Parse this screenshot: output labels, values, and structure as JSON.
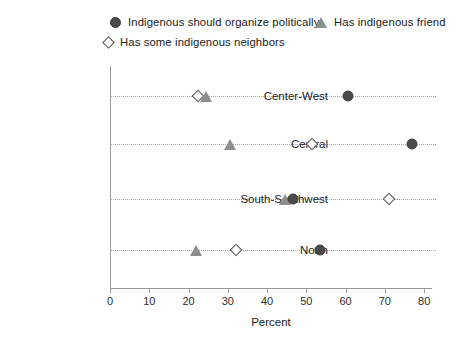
{
  "legend": {
    "entries": [
      {
        "label": "Indigenous should organize politically",
        "marker": "circle-icon",
        "color": "#4b4b4b"
      },
      {
        "label": "Has indigenous friend",
        "marker": "triangle-icon",
        "color": "#8e8e8e"
      },
      {
        "label": "Has some indigenous neighbors",
        "marker": "diamond-icon",
        "color": "#ffffff"
      }
    ]
  },
  "axis": {
    "x_label": "Percent",
    "x_ticks": [
      "0",
      "10",
      "20",
      "30",
      "40",
      "50",
      "60",
      "70",
      "80"
    ]
  },
  "chart_data": {
    "type": "scatter",
    "title": "",
    "subtitle": "",
    "xlabel": "Percent",
    "ylabel": "",
    "xlim": [
      0,
      82
    ],
    "grid": true,
    "grid_style": "dotted horizontal per category",
    "legend_position": "top",
    "orientation": "horizontal dot plot",
    "categories": [
      "Center-West",
      "Central",
      "South-Southwest",
      "North"
    ],
    "series": [
      {
        "name": "Indigenous should organize politically",
        "marker": "circle",
        "color": "#4b4b4b",
        "values": [
          60.5,
          77.0,
          46.5,
          53.5
        ]
      },
      {
        "name": "Has indigenous friend",
        "marker": "triangle",
        "color": "#8e8e8e",
        "values": [
          24.5,
          30.5,
          44.5,
          22.0
        ]
      },
      {
        "name": "Has some indigenous neighbors",
        "marker": "diamond",
        "color": "#ffffff",
        "values": [
          22.5,
          51.5,
          71.0,
          32.0
        ]
      }
    ]
  }
}
